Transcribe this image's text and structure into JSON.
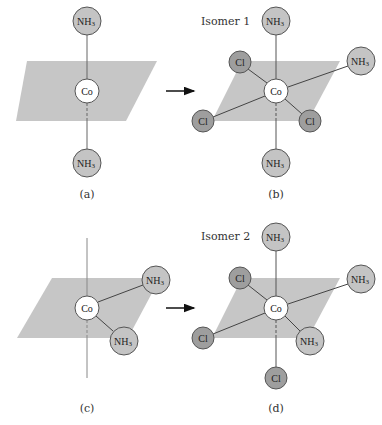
{
  "colors": {
    "plane": "#c6c6c6",
    "nh3_fill": "#c4c4c4",
    "cl_fill": "#9e9e9e",
    "co_fill": "#ffffff",
    "stroke": "#555555",
    "line": "#666666",
    "arrow": "#111111"
  },
  "atoms": {
    "co": "Co",
    "nh3_main": "NH",
    "nh3_sub": "3",
    "cl": "Cl"
  },
  "panels": {
    "a": {
      "caption": "(a)",
      "plane": "27,61 157,61 126,121 16,121",
      "center": {
        "x": 87,
        "y": 91
      },
      "ligands": [
        {
          "type": "nh3",
          "x": 87,
          "y": 21,
          "bond": "solid"
        },
        {
          "type": "nh3",
          "x": 87,
          "y": 163,
          "bond": "dashed-below"
        }
      ]
    },
    "b": {
      "caption": "(b)",
      "title": "Isomer 1",
      "plane": "242,61 372,61 340,121 212,121",
      "center": {
        "x": 276,
        "y": 91
      },
      "ligands": [
        {
          "type": "nh3",
          "x": 276,
          "y": 21
        },
        {
          "type": "cl",
          "x": 240,
          "y": 62
        },
        {
          "type": "nh3",
          "x": 361,
          "y": 61
        },
        {
          "type": "cl",
          "x": 203,
          "y": 121
        },
        {
          "type": "cl",
          "x": 310,
          "y": 121
        },
        {
          "type": "nh3",
          "x": 276,
          "y": 163
        }
      ]
    },
    "c": {
      "caption": "(c)",
      "plane": "52,278 160,278 128,338 17,338",
      "center": {
        "x": 87,
        "y": 308
      },
      "axis": {
        "y1": 238,
        "y2": 378
      },
      "ligands": [
        {
          "type": "nh3",
          "x": 156,
          "y": 280
        },
        {
          "type": "nh3",
          "x": 124,
          "y": 341
        }
      ]
    },
    "d": {
      "caption": "(d)",
      "title": "Isomer 2",
      "plane": "242,278 372,278 340,338 212,338",
      "center": {
        "x": 276,
        "y": 308
      },
      "ligands": [
        {
          "type": "nh3",
          "x": 276,
          "y": 237
        },
        {
          "type": "cl",
          "x": 240,
          "y": 278
        },
        {
          "type": "nh3",
          "x": 361,
          "y": 279
        },
        {
          "type": "cl",
          "x": 203,
          "y": 338
        },
        {
          "type": "nh3",
          "x": 310,
          "y": 341
        },
        {
          "type": "cl",
          "x": 276,
          "y": 378
        }
      ]
    }
  },
  "arrows": [
    {
      "name": "arrow-a-to-b",
      "x1": 166,
      "x2": 194,
      "y": 91
    },
    {
      "name": "arrow-c-to-d",
      "x1": 166,
      "x2": 194,
      "y": 308
    }
  ]
}
